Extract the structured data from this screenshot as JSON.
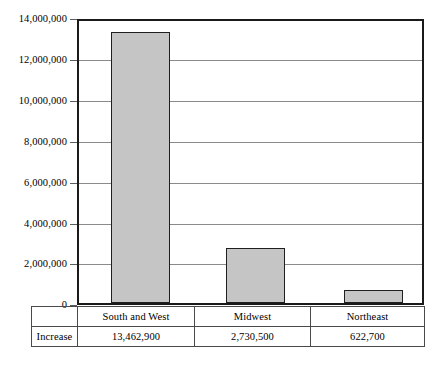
{
  "chart_data": {
    "type": "bar",
    "title": "",
    "xlabel": "",
    "ylabel": "",
    "categories": [
      "South and West",
      "Midwest",
      "Northeast"
    ],
    "values": [
      13462900,
      2730500,
      622700
    ],
    "value_labels": [
      "13,462,900",
      "2,730,500",
      "622,700"
    ],
    "series": [
      {
        "name": "Increase",
        "values": [
          13462900,
          2730500,
          622700
        ]
      }
    ],
    "ylim": [
      0,
      14000000
    ],
    "ytick_values": [
      0,
      2000000,
      4000000,
      6000000,
      8000000,
      10000000,
      12000000,
      14000000
    ],
    "ytick_labels": [
      "0",
      "2,000,000",
      "4,000,000",
      "6,000,000",
      "8,000,000",
      "10,000,000",
      "12,000,000",
      "14,000,000"
    ],
    "grid": true,
    "legend": "none",
    "bar_fill_color": "#c5c5c5",
    "bar_border_color": "#1f1f1f",
    "gridline_color": "#8a8a8a",
    "axis_color": "#1a1a1a"
  },
  "table": {
    "row_label": "Increase",
    "header_cells": [
      "South and West",
      "Midwest",
      "Northeast"
    ],
    "data_cells": [
      "13,462,900",
      "2,730,500",
      "622,700"
    ]
  }
}
